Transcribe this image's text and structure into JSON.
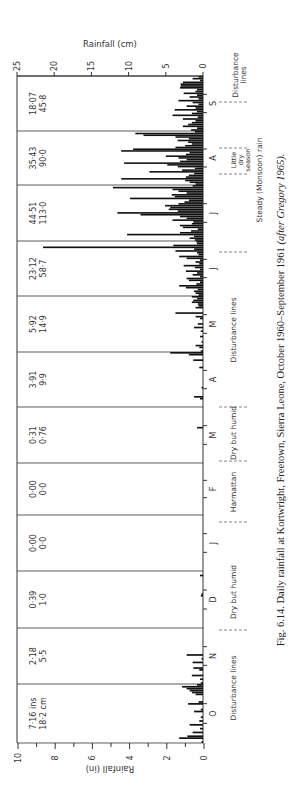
{
  "chart_data": {
    "type": "bar",
    "orientation": "rotated-90-ccw",
    "title": "Fig. 6.14.  Daily rainfall at Kortwright, Freetown, Sierra Leone, October 1960–September 1961",
    "title_italic_suffix": "(after Gregory 1965).",
    "ylabel_cm": "Rainfall (cm)",
    "ylabel_in": "Rainfall (in)",
    "ylim_cm": [
      0,
      25
    ],
    "ylim_in": [
      0,
      10
    ],
    "ticks_cm": [
      "25",
      "20",
      "15",
      "10",
      "5",
      "0"
    ],
    "ticks_in": [
      "10",
      "8",
      "6",
      "4",
      "2",
      "0"
    ],
    "categories": [
      "O",
      "N",
      "D",
      "J",
      "F",
      "M",
      "A",
      "M",
      "J",
      "J",
      "A",
      "S"
    ],
    "monthly_totals": [
      {
        "month": "O",
        "inches": "7·16 ins",
        "cm": "18·2 cm"
      },
      {
        "month": "N",
        "inches": "2·18",
        "cm": "5·5"
      },
      {
        "month": "D",
        "inches": "0·39",
        "cm": "1·0"
      },
      {
        "month": "J",
        "inches": "0·00",
        "cm": "0·0"
      },
      {
        "month": "F",
        "inches": "0·00",
        "cm": "0·0"
      },
      {
        "month": "M",
        "inches": "0·31",
        "cm": "0·76"
      },
      {
        "month": "A",
        "inches": "3·91",
        "cm": "9·9"
      },
      {
        "month": "M",
        "inches": "5·92",
        "cm": "14·9"
      },
      {
        "month": "J",
        "inches": "23·12",
        "cm": "58·7"
      },
      {
        "month": "J",
        "inches": "44·51",
        "cm": "113·0"
      },
      {
        "month": "A",
        "inches": "35·43",
        "cm": "90·0"
      },
      {
        "month": "S",
        "inches": "18·07",
        "cm": "45·8"
      }
    ],
    "seasons": [
      {
        "label": "Disturbance lines",
        "from": "O",
        "to": "N"
      },
      {
        "label": "Dry but humid",
        "from": "N",
        "to": "D"
      },
      {
        "label": "Harmattan",
        "from": "D",
        "to": "F"
      },
      {
        "label": "Dry but humid",
        "from": "F",
        "to": "A"
      },
      {
        "label": "Disturbance lines",
        "from": "A",
        "to": "J"
      },
      {
        "label": "Steady (Monsoon) rain",
        "from": "J",
        "to": "A"
      },
      {
        "label": "Little dry season",
        "from": "A",
        "to": "A"
      },
      {
        "label": "Disturbance lines",
        "from": "S",
        "to": "S"
      }
    ],
    "daily_cm_estimated": {
      "O": [
        0.2,
        0,
        3.2,
        2.1,
        0,
        1.4,
        0,
        0.4,
        0,
        1.8,
        0,
        0.5,
        0,
        0.3,
        0,
        0,
        1.2,
        0.3,
        0,
        0,
        2.0,
        0.6,
        0,
        0,
        0,
        1.0,
        1.5,
        1.8,
        2.2,
        2.8,
        0.8
      ],
      "N": [
        0.3,
        0,
        0.4,
        0,
        1.5,
        0,
        0,
        0.5,
        1.3,
        0,
        0,
        1.4,
        0,
        0.2,
        0,
        2.2,
        0,
        0,
        0,
        0,
        0,
        0,
        0,
        0,
        0,
        0,
        0,
        0,
        0,
        0
      ],
      "D": [
        0,
        0,
        0,
        0,
        0,
        0,
        0,
        0,
        0,
        0,
        0,
        0,
        0,
        0,
        0,
        0,
        0,
        0.3,
        0.2,
        0,
        0,
        0,
        0,
        0,
        0,
        0,
        0,
        0,
        0.4,
        0,
        0
      ],
      "J": [
        1.1,
        1.8,
        1.2,
        10.2,
        3.1,
        1.6,
        0.7,
        2.7,
        3.1,
        1.5,
        1.3,
        4.1,
        2.2,
        3.1,
        8.4,
        11.5,
        3.4,
        4.6,
        4.4,
        5.1,
        3.3,
        2.5,
        1.9,
        9.8,
        3.8,
        4.2,
        2.2,
        3.3,
        4.1,
        12.1,
        1.4
      ],
      "F": [
        0,
        0,
        0,
        0,
        0,
        0,
        0,
        0,
        0,
        0,
        0,
        0,
        0,
        0,
        0,
        0,
        0,
        0,
        0,
        0,
        0,
        0,
        0,
        0,
        0,
        0,
        0,
        0
      ],
      "M": [
        0.3,
        0,
        0.5,
        1.0,
        0,
        0.2,
        0,
        0,
        0.4,
        0,
        0,
        0.3,
        0,
        1.2,
        0,
        0.7,
        0,
        0,
        0.4,
        1.0,
        0,
        3.7,
        0,
        0,
        1.0,
        0.6,
        0.7,
        1.5,
        1.3,
        0.8,
        1.5
      ],
      "A": [
        1.0,
        1.8,
        2.4,
        11.0,
        2.3,
        1.9,
        1.2,
        7.2,
        2.8,
        1.1,
        3.4,
        4.8,
        10.6,
        3.1,
        2.2,
        3.3,
        5.0,
        2.3,
        1.8,
        11.0,
        9.4,
        3.7,
        2.4,
        1.5,
        2.0,
        3.4,
        1.9,
        3.7,
        8.0,
        9.1,
        1.1
      ],
      "S": [
        1.6,
        0.8,
        2.7,
        2.0,
        1.5,
        1.0,
        2.7,
        0.7,
        4.1,
        1.5,
        0.8,
        3.8,
        1.0,
        2.2,
        0.6,
        1.4,
        3.3,
        0.6,
        1.8,
        0.8,
        2.6,
        1.0,
        0.8,
        3.1,
        3.0,
        3.0,
        2.7,
        0.4,
        1.4,
        0.6
      ]
    }
  },
  "figure": {
    "caption_prefix": "Fig. 6.14.  Daily rainfall at Kortwright, Freetown, Sierra Leone, October 1960–September 1961 ",
    "caption_italic": "(after Gregory 1965).",
    "axis_label_cm": "Rainfall (cm)",
    "axis_label_in": "Rainfall (in)",
    "colors": {
      "bars": "#111111",
      "frame": "#333333",
      "text": "#333333",
      "dashes": "#888888"
    }
  }
}
